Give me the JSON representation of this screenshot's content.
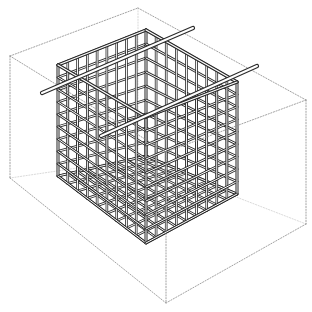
{
  "figure": {
    "title": "",
    "colors": {
      "background": "#ffffff",
      "wire": "#2a2a2a",
      "wire_highlight": "#ffffff",
      "box": "#8a8a8a"
    },
    "outer_box": {
      "style": "dotted",
      "top": [
        [
          138,
          8
        ],
        [
          306,
          100
        ],
        [
          166,
          152
        ],
        [
          10,
          56
        ]
      ],
      "bottom_front": [
        166,
        303
      ],
      "bottom_left": [
        10,
        178
      ],
      "bottom_right": [
        306,
        224
      ]
    },
    "basket": {
      "grid_cells_per_face": 9,
      "top_back": [
        146,
        30
      ],
      "top_left": [
        58,
        65
      ],
      "top_right": [
        237,
        82
      ],
      "top_front": [
        146,
        117
      ],
      "bottom_left": [
        58,
        176
      ],
      "bottom_front": [
        146,
        243
      ],
      "bottom_right": [
        237,
        194
      ]
    },
    "rods": [
      {
        "name": "rod-1",
        "from": [
          42,
          93
        ],
        "to": [
          193,
          28
        ]
      },
      {
        "name": "rod-2",
        "from": [
          101,
          136
        ],
        "to": [
          257,
          66
        ]
      }
    ]
  }
}
